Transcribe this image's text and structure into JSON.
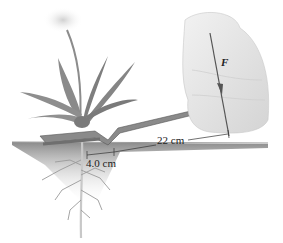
{
  "figure": {
    "labels": {
      "force": "F",
      "long_arm": "22 cm",
      "short_arm": "4.0 cm"
    },
    "colors": {
      "background": "#ffffff",
      "soil": "#8d8d8d",
      "tool": "#8a8a8a",
      "plant": "#7b7b7b",
      "hand": "#e6e6e6",
      "arrow": "#555555",
      "text": "#222222"
    }
  }
}
